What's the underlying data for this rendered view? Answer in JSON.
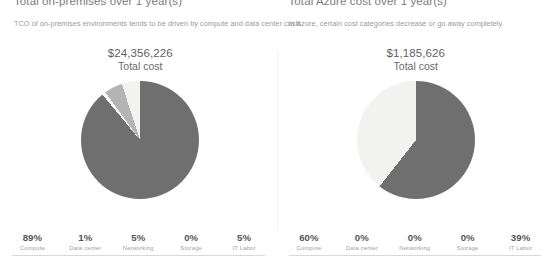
{
  "panels": [
    {
      "title": "Total on-premises over 1 year(s)",
      "subtitle": "TCO of on-premises environments tends to be driven by compute and data center costs.",
      "total_amount": "$24,356,226",
      "total_label": "Total cost",
      "legend": [
        {
          "pct": "89%",
          "name": "Compute"
        },
        {
          "pct": "1%",
          "name": "Data center"
        },
        {
          "pct": "5%",
          "name": "Networking"
        },
        {
          "pct": "0%",
          "name": "Storage"
        },
        {
          "pct": "5%",
          "name": "IT Labor"
        }
      ]
    },
    {
      "title": "Total Azure cost over 1 year(s)",
      "subtitle": "In Azure, certain cost categories decrease or go away completely.",
      "total_amount": "$1,185,626",
      "total_label": "Total cost",
      "legend": [
        {
          "pct": "60%",
          "name": "Compute"
        },
        {
          "pct": "0%",
          "name": "Data center"
        },
        {
          "pct": "0%",
          "name": "Networking"
        },
        {
          "pct": "0%",
          "name": "Storage"
        },
        {
          "pct": "39%",
          "name": "IT Labor"
        }
      ]
    }
  ],
  "colors": {
    "compute": "#6f6f6f",
    "data_center": "#f7f7f5",
    "networking": "#b4b4b4",
    "storage": "#8f8f8f",
    "it_labor": "#f2f2f0",
    "background": "#ffffff",
    "rule": "#d9d9d7",
    "divider": "#f3f3f1"
  },
  "chart_data": [
    {
      "type": "pie",
      "title": "Total on-premises over 1 year(s)",
      "categories": [
        "Compute",
        "Data center",
        "Networking",
        "Storage",
        "IT Labor"
      ],
      "values": [
        89,
        1,
        5,
        0,
        5
      ],
      "unit": "%",
      "total": "$24,356,226",
      "legend_position": "bottom",
      "colors": [
        "#6f6f6f",
        "#f7f7f5",
        "#b4b4b4",
        "#8f8f8f",
        "#f2f2f0"
      ]
    },
    {
      "type": "pie",
      "title": "Total Azure cost over 1 year(s)",
      "categories": [
        "Compute",
        "Data center",
        "Networking",
        "Storage",
        "IT Labor"
      ],
      "values": [
        60,
        0,
        0,
        0,
        39
      ],
      "unit": "%",
      "total": "$1,185,626",
      "legend_position": "bottom",
      "colors": [
        "#6f6f6f",
        "#f7f7f5",
        "#b4b4b4",
        "#8f8f8f",
        "#f2f2f0"
      ]
    }
  ]
}
